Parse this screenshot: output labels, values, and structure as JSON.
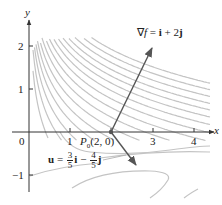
{
  "figure": {
    "axes": {
      "x_label": "x",
      "y_label": "y",
      "origin_label": "0",
      "x_ticks": [
        "1",
        "2",
        "3",
        "4"
      ],
      "x_tick_labels_shown": [
        "1",
        "3",
        "4"
      ],
      "y_ticks": [
        "2",
        "1",
        "-1"
      ],
      "y_tick_labels": {
        "two": "2",
        "one": "1",
        "minus_one": "−1"
      }
    },
    "point": {
      "name_main": "P",
      "name_sub": "0",
      "coords": "(2, 0)"
    },
    "gradient_label": {
      "nabla": "∇",
      "f": "f",
      "eq": " = ",
      "i": "i",
      "plus": " + 2",
      "j": "j"
    },
    "unit_vector_label": {
      "u": "u",
      "eq": " = ",
      "frac1_num": "3",
      "frac1_den": "5",
      "i": "i",
      "minus": " − ",
      "frac2_num": "4",
      "frac2_den": "5",
      "j": "j"
    },
    "colors": {
      "axis": "#333333",
      "contour": "#c4c4c4",
      "vector": "#555555",
      "point": "#555555"
    }
  },
  "chart_data": {
    "type": "diagram",
    "xlim": [
      0,
      4.3
    ],
    "ylim": [
      -1.4,
      2.4
    ],
    "point": {
      "label": "P0",
      "x": 2,
      "y": 0
    },
    "vectors": [
      {
        "name": "gradient",
        "label": "∇f = i + 2j",
        "from": [
          2,
          0
        ],
        "to": [
          3,
          2
        ]
      },
      {
        "name": "u",
        "label": "u = 3/5 i − 4/5 j",
        "from": [
          2,
          0
        ],
        "to": [
          2.6,
          -0.8
        ]
      }
    ],
    "contour_function_hint": "f(x, y) = x e^y (level curves y = ln(c/x))"
  }
}
